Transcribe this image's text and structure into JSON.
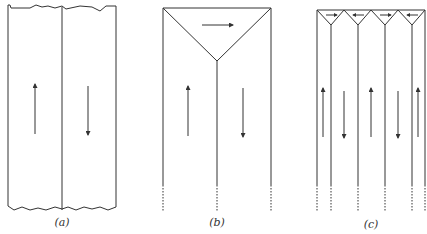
{
  "figure": {
    "line_color": "#333333",
    "panels": [
      {
        "id": "a",
        "caption": "(a)",
        "arrows": [
          "up",
          "down"
        ]
      },
      {
        "id": "b",
        "caption": "(b)",
        "arrows": [
          "up",
          "down"
        ],
        "closure_arrows": [
          "right"
        ]
      },
      {
        "id": "c",
        "caption": "(c)",
        "arrows": [
          "up",
          "down",
          "up",
          "down",
          "up"
        ],
        "closure_arrows": [
          "right",
          "left",
          "right",
          "left"
        ]
      }
    ]
  }
}
